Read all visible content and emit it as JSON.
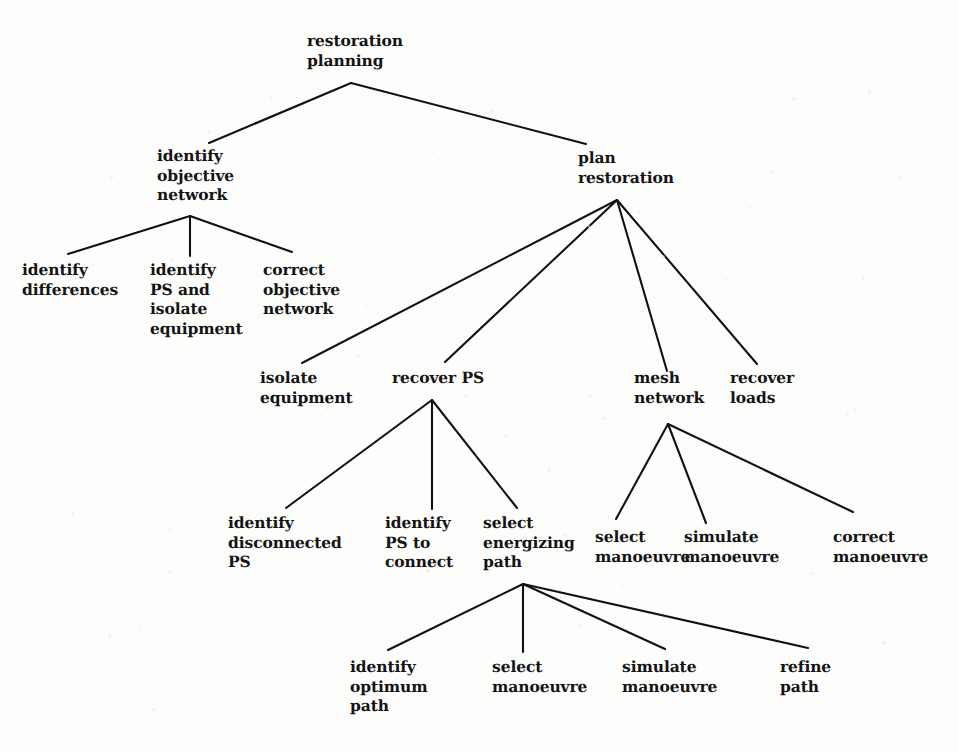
{
  "diagram": {
    "type": "hierarchical-tree",
    "line_color": "#111111",
    "text_color": "#141414",
    "background_color": "#fdfdfc",
    "width": 959,
    "height": 752
  },
  "nodes": [
    {
      "id": "restoration-planning",
      "lines": [
        "restoration",
        "planning"
      ],
      "x": 307,
      "y": 31,
      "anchor": {
        "x": 351,
        "y": 83
      }
    },
    {
      "id": "identify-objective-network",
      "lines": [
        "identify",
        "objective",
        "network"
      ],
      "x": 157,
      "y": 146,
      "anchor": {
        "x": 190,
        "y": 216
      }
    },
    {
      "id": "plan-restoration",
      "lines": [
        "plan",
        "restoration"
      ],
      "x": 578,
      "y": 148,
      "anchor": {
        "x": 617,
        "y": 200
      }
    },
    {
      "id": "identify-differences",
      "lines": [
        "identify",
        "differences"
      ],
      "x": 22,
      "y": 260,
      "anchor": {
        "x": 66,
        "y": 255
      }
    },
    {
      "id": "identify-ps-and-isolate-equipment",
      "lines": [
        "identify",
        "PS and",
        "isolate",
        "equipment"
      ],
      "x": 150,
      "y": 260,
      "anchor": {
        "x": 190,
        "y": 255
      }
    },
    {
      "id": "correct-objective-network",
      "lines": [
        "correct",
        "objective",
        "network"
      ],
      "x": 263,
      "y": 260,
      "anchor": {
        "x": 290,
        "y": 253
      }
    },
    {
      "id": "isolate-equipment",
      "lines": [
        "isolate",
        "equipment"
      ],
      "x": 260,
      "y": 368,
      "anchor": {
        "x": 303,
        "y": 363
      }
    },
    {
      "id": "recover-ps",
      "lines": [
        "recover PS"
      ],
      "x": 392,
      "y": 368,
      "anchor": {
        "x": 432,
        "y": 400
      }
    },
    {
      "id": "mesh-network",
      "lines": [
        "mesh",
        "network"
      ],
      "x": 634,
      "y": 368,
      "anchor": {
        "x": 668,
        "y": 424
      }
    },
    {
      "id": "recover-loads",
      "lines": [
        "recover",
        "loads"
      ],
      "x": 730,
      "y": 368,
      "anchor": {
        "x": 757,
        "y": 363
      }
    },
    {
      "id": "identify-disconnected-ps",
      "lines": [
        "identify",
        "disconnected",
        "PS"
      ],
      "x": 228,
      "y": 513,
      "anchor": {
        "x": 286,
        "y": 507
      }
    },
    {
      "id": "identify-ps-to-connect",
      "lines": [
        "identify",
        "PS to",
        "connect"
      ],
      "x": 385,
      "y": 513,
      "anchor": {
        "x": 432,
        "y": 509
      }
    },
    {
      "id": "select-energizing-path",
      "lines": [
        "select",
        "energizing",
        "path"
      ],
      "x": 483,
      "y": 513,
      "anchor": {
        "x": 523,
        "y": 584
      }
    },
    {
      "id": "select-manoeuvre-mesh",
      "lines": [
        "select",
        "manoeuvre"
      ],
      "x": 595,
      "y": 527,
      "anchor": {
        "x": 618,
        "y": 518
      }
    },
    {
      "id": "simulate-manoeuvre-mesh",
      "lines": [
        "simulate",
        "manoeuvre"
      ],
      "x": 684,
      "y": 527,
      "anchor": {
        "x": 707,
        "y": 522
      }
    },
    {
      "id": "correct-manoeuvre",
      "lines": [
        "correct",
        "manoeuvre"
      ],
      "x": 833,
      "y": 527,
      "anchor": {
        "x": 852,
        "y": 512
      }
    },
    {
      "id": "identify-optimum-path",
      "lines": [
        "identify",
        "optimum",
        "path"
      ],
      "x": 350,
      "y": 657,
      "anchor": {
        "x": 388,
        "y": 650
      }
    },
    {
      "id": "select-manoeuvre-path",
      "lines": [
        "select",
        "manoeuvre"
      ],
      "x": 492,
      "y": 657,
      "anchor": {
        "x": 523,
        "y": 652
      }
    },
    {
      "id": "simulate-manoeuvre-path",
      "lines": [
        "simulate",
        "manoeuvre"
      ],
      "x": 622,
      "y": 657,
      "anchor": {
        "x": 665,
        "y": 650
      }
    },
    {
      "id": "refine-path",
      "lines": [
        "refine",
        "path"
      ],
      "x": 780,
      "y": 657,
      "anchor": {
        "x": 808,
        "y": 650
      }
    }
  ],
  "edges": [
    {
      "from": "restoration-planning",
      "to": "identify-objective-network",
      "x1": 351,
      "y1": 83,
      "x2": 209,
      "y2": 143
    },
    {
      "from": "restoration-planning",
      "to": "plan-restoration",
      "x1": 351,
      "y1": 83,
      "x2": 586,
      "y2": 144
    },
    {
      "from": "identify-objective-network",
      "to": "identify-differences",
      "x1": 190,
      "y1": 216,
      "x2": 68,
      "y2": 254
    },
    {
      "from": "identify-objective-network",
      "to": "identify-ps-and-isolate-equipment",
      "x1": 190,
      "y1": 216,
      "x2": 190,
      "y2": 256
    },
    {
      "from": "identify-objective-network",
      "to": "correct-objective-network",
      "x1": 190,
      "y1": 216,
      "x2": 292,
      "y2": 252
    },
    {
      "from": "plan-restoration",
      "to": "isolate-equipment",
      "x1": 617,
      "y1": 200,
      "x2": 302,
      "y2": 363
    },
    {
      "from": "plan-restoration",
      "to": "recover-ps",
      "x1": 617,
      "y1": 200,
      "x2": 445,
      "y2": 362
    },
    {
      "from": "plan-restoration",
      "to": "mesh-network",
      "x1": 617,
      "y1": 200,
      "x2": 667,
      "y2": 371
    },
    {
      "from": "plan-restoration",
      "to": "recover-loads",
      "x1": 617,
      "y1": 200,
      "x2": 757,
      "y2": 364
    },
    {
      "from": "recover-ps",
      "to": "identify-disconnected-ps",
      "x1": 432,
      "y1": 400,
      "x2": 286,
      "y2": 508
    },
    {
      "from": "recover-ps",
      "to": "identify-ps-to-connect",
      "x1": 432,
      "y1": 400,
      "x2": 432,
      "y2": 509
    },
    {
      "from": "recover-ps",
      "to": "select-energizing-path",
      "x1": 432,
      "y1": 400,
      "x2": 517,
      "y2": 508
    },
    {
      "from": "mesh-network",
      "to": "select-manoeuvre-mesh",
      "x1": 668,
      "y1": 424,
      "x2": 616,
      "y2": 519
    },
    {
      "from": "mesh-network",
      "to": "simulate-manoeuvre-mesh",
      "x1": 668,
      "y1": 424,
      "x2": 706,
      "y2": 523
    },
    {
      "from": "mesh-network",
      "to": "correct-manoeuvre",
      "x1": 668,
      "y1": 424,
      "x2": 853,
      "y2": 512
    },
    {
      "from": "select-energizing-path",
      "to": "identify-optimum-path",
      "x1": 523,
      "y1": 584,
      "x2": 388,
      "y2": 650
    },
    {
      "from": "select-energizing-path",
      "to": "select-manoeuvre-path",
      "x1": 523,
      "y1": 584,
      "x2": 523,
      "y2": 652
    },
    {
      "from": "select-energizing-path",
      "to": "simulate-manoeuvre-path",
      "x1": 523,
      "y1": 584,
      "x2": 665,
      "y2": 649
    },
    {
      "from": "select-energizing-path",
      "to": "refine-path",
      "x1": 523,
      "y1": 584,
      "x2": 808,
      "y2": 648
    }
  ]
}
